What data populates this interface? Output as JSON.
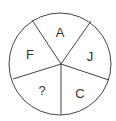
{
  "puzzle": {
    "type": "letter-wheel",
    "segments": [
      {
        "position": "top",
        "label": "A"
      },
      {
        "position": "right",
        "label": "J"
      },
      {
        "position": "bottom-right",
        "label": "C"
      },
      {
        "position": "bottom-left",
        "label": "?"
      },
      {
        "position": "left",
        "label": "F"
      }
    ]
  },
  "colors": {
    "stroke": "#333333",
    "text": "#333333",
    "background": "#ffffff"
  }
}
